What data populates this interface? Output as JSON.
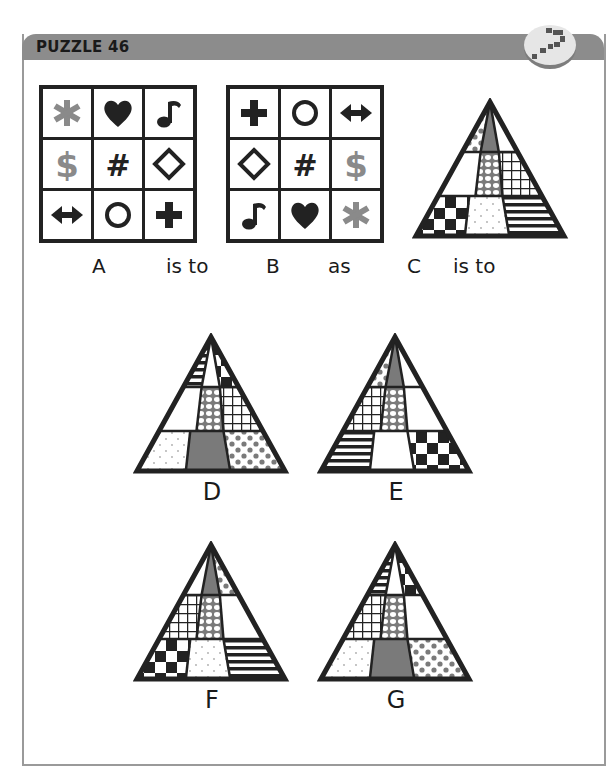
{
  "header": {
    "title": "PUZZLE 46",
    "badge_icon": "question-mark-blocks-icon"
  },
  "colors": {
    "header_bg": "#8c8c8c",
    "ink": "#222222",
    "gray_symbol": "#8a8a8a",
    "gray_fill": "#7a7a7a",
    "frame": "#9a9a9a"
  },
  "statement": {
    "labels": [
      "A",
      "is to",
      "B",
      "as",
      "C",
      "is to"
    ]
  },
  "grids": {
    "A": [
      [
        "asterisk-gray",
        "heart",
        "music-note"
      ],
      [
        "dollar-gray",
        "hash",
        "diamond-outline"
      ],
      [
        "double-arrow",
        "circle-outline",
        "plus"
      ]
    ],
    "B": [
      [
        "plus",
        "circle-outline",
        "double-arrow"
      ],
      [
        "diamond-outline",
        "hash",
        "dollar-gray"
      ],
      [
        "music-note",
        "heart",
        "asterisk-gray"
      ]
    ]
  },
  "pyramids": {
    "C": {
      "label": "C",
      "top": [
        "dots-gray",
        "solid-gray",
        "blank"
      ],
      "middle": [
        "blank",
        "hex-dots",
        "grid"
      ],
      "bottom": [
        "checker",
        "fine-dots",
        "stripes-h"
      ]
    },
    "D": {
      "label": "D",
      "top": [
        "stripes-h",
        "blank",
        "checker"
      ],
      "middle": [
        "blank",
        "hex-dots",
        "grid"
      ],
      "bottom": [
        "fine-dots",
        "solid-gray",
        "dots-gray"
      ]
    },
    "E": {
      "label": "E",
      "top": [
        "dots-gray",
        "solid-gray",
        "blank"
      ],
      "middle": [
        "grid",
        "hex-dots",
        "blank"
      ],
      "bottom": [
        "stripes-h",
        "blank",
        "checker"
      ]
    },
    "F": {
      "label": "F",
      "top": [
        "blank",
        "solid-gray",
        "dots-gray"
      ],
      "middle": [
        "grid",
        "hex-dots",
        "blank"
      ],
      "bottom": [
        "checker",
        "fine-dots",
        "stripes-h"
      ]
    },
    "G": {
      "label": "G",
      "top": [
        "stripes-h",
        "blank",
        "checker"
      ],
      "middle": [
        "grid",
        "hex-dots",
        "blank"
      ],
      "bottom": [
        "fine-dots",
        "solid-gray",
        "dots-gray"
      ]
    }
  },
  "answer_options": [
    "D",
    "E",
    "F",
    "G"
  ]
}
